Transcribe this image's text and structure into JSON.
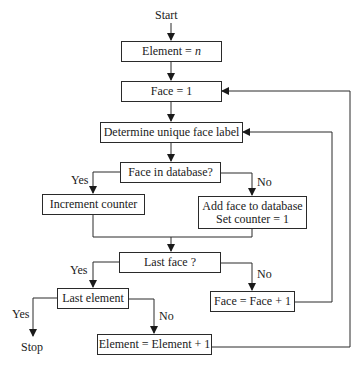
{
  "diagram": {
    "type": "flowchart",
    "terminals": {
      "start": "Start",
      "stop": "Stop"
    },
    "nodes": {
      "element_init": {
        "text": "Element = ",
        "var": "n"
      },
      "face_init": "Face = 1",
      "determine_label": "Determine unique face label",
      "face_in_db": "Face in database?",
      "increment_counter": "Increment counter",
      "add_face_line1": "Add face to database",
      "add_face_line2": "Set counter = 1",
      "last_face": "Last face ?",
      "face_increment": "Face = Face + 1",
      "last_element": "Last element",
      "element_increment": "Element = Element + 1"
    },
    "branch_labels": {
      "face_in_db_yes": "Yes",
      "face_in_db_no": "No",
      "last_face_yes": "Yes",
      "last_face_no": "No",
      "last_element_yes": "Yes",
      "last_element_no": "No"
    },
    "edges": [
      {
        "from": "start",
        "to": "element_init"
      },
      {
        "from": "element_init",
        "to": "face_init"
      },
      {
        "from": "face_init",
        "to": "determine_label"
      },
      {
        "from": "determine_label",
        "to": "face_in_db"
      },
      {
        "from": "face_in_db",
        "to": "increment_counter",
        "label": "Yes"
      },
      {
        "from": "face_in_db",
        "to": "add_face",
        "label": "No"
      },
      {
        "from": "increment_counter",
        "to": "last_face"
      },
      {
        "from": "add_face",
        "to": "last_face"
      },
      {
        "from": "last_face",
        "to": "last_element",
        "label": "Yes"
      },
      {
        "from": "last_face",
        "to": "face_increment",
        "label": "No"
      },
      {
        "from": "face_increment",
        "to": "determine_label"
      },
      {
        "from": "last_element",
        "to": "stop",
        "label": "Yes"
      },
      {
        "from": "last_element",
        "to": "element_increment",
        "label": "No"
      },
      {
        "from": "element_increment",
        "to": "face_init"
      }
    ]
  }
}
